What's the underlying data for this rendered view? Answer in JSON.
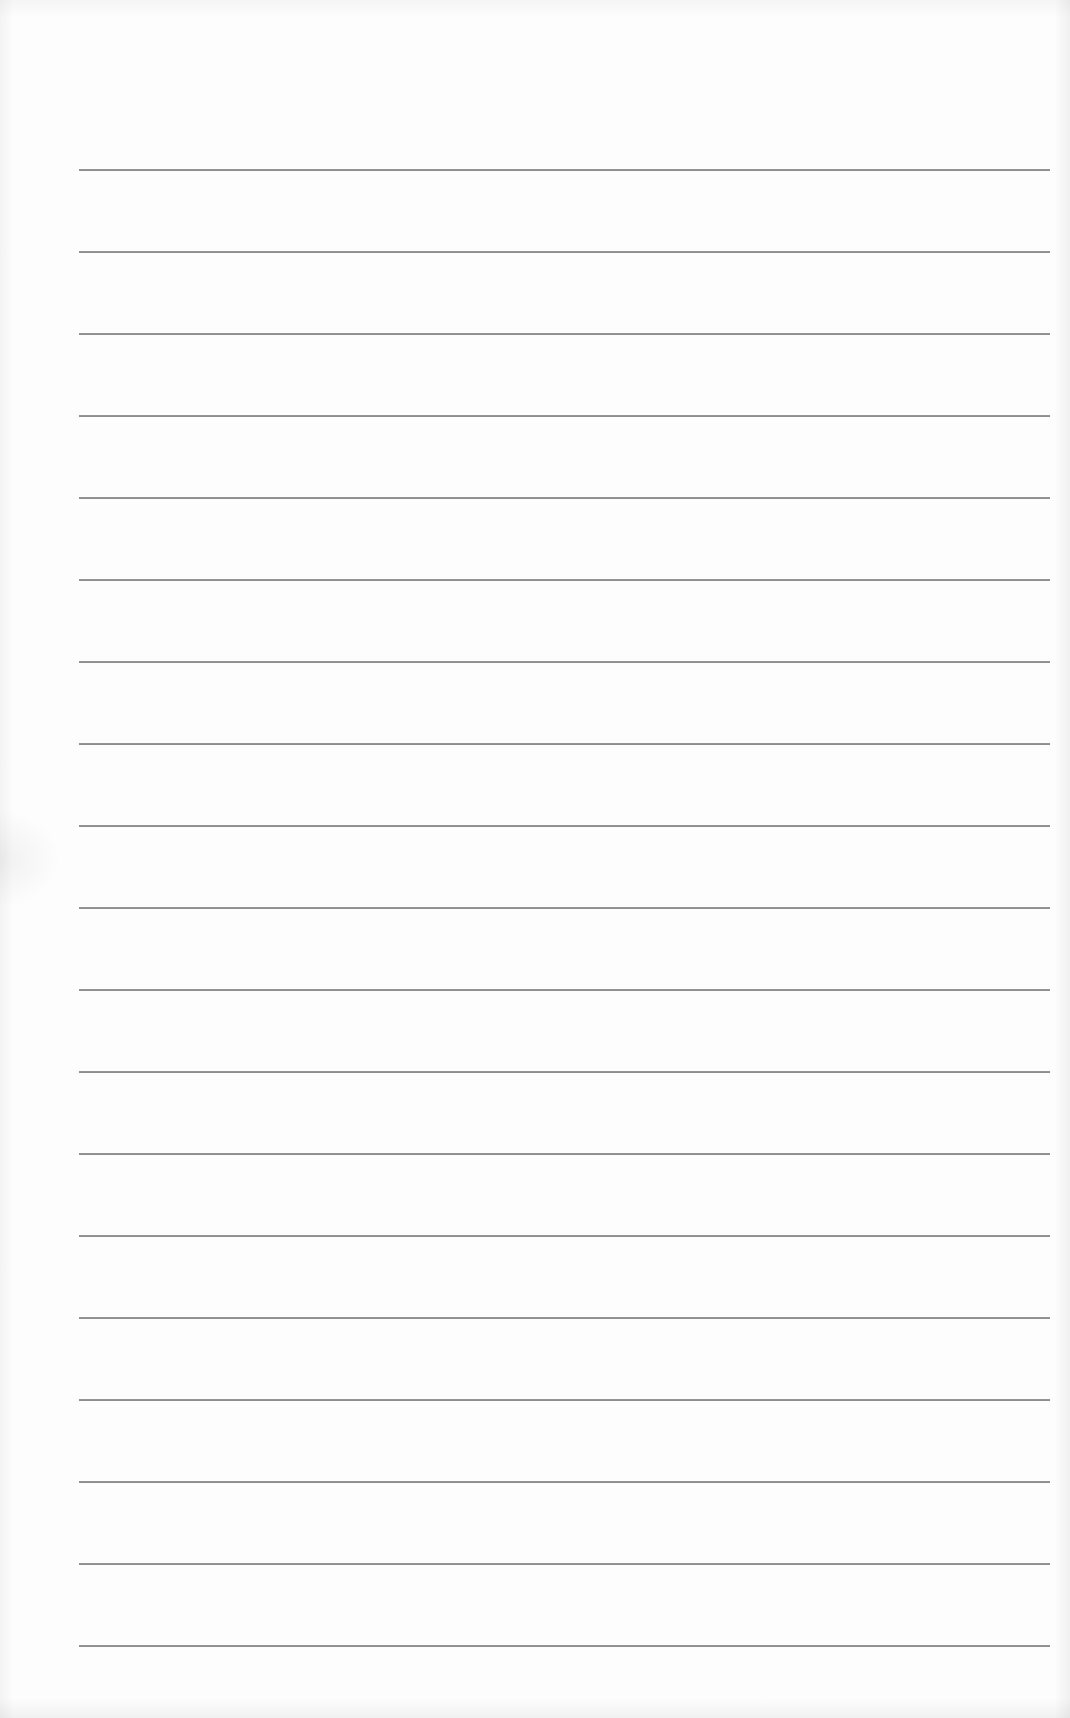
{
  "page": {
    "type": "lined-paper",
    "background": "#fdfdfd",
    "line_color": "#8e8e8e",
    "line_left": 79,
    "line_right": 1050,
    "line_top_first": 169,
    "line_spacing": 82,
    "line_count": 19,
    "lines": [
      {
        "y": 169
      },
      {
        "y": 251
      },
      {
        "y": 333
      },
      {
        "y": 415
      },
      {
        "y": 497
      },
      {
        "y": 579
      },
      {
        "y": 661
      },
      {
        "y": 743
      },
      {
        "y": 825
      },
      {
        "y": 907
      },
      {
        "y": 989
      },
      {
        "y": 1071
      },
      {
        "y": 1153
      },
      {
        "y": 1235
      },
      {
        "y": 1317
      },
      {
        "y": 1399
      },
      {
        "y": 1481
      },
      {
        "y": 1563
      },
      {
        "y": 1645
      }
    ]
  }
}
